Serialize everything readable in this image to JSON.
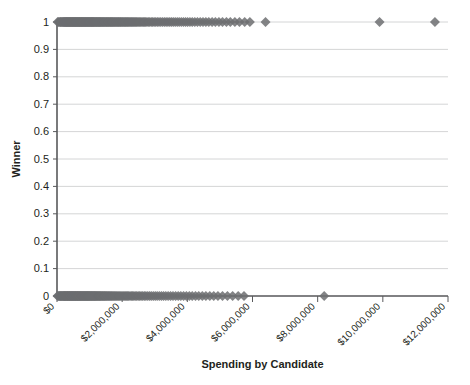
{
  "chart_data": {
    "type": "scatter",
    "title": "",
    "xlabel": "Spending by Candidate",
    "ylabel": "Winner",
    "xlim": [
      0,
      12000000
    ],
    "ylim": [
      0,
      1
    ],
    "grid": true,
    "grid_axis": "y",
    "legend": "none",
    "marker": "diamond",
    "marker_color": "#6d6e71",
    "marker_size": 5,
    "y_ticks": [
      0,
      0.1,
      0.2,
      0.3,
      0.4,
      0.5,
      0.6,
      0.7,
      0.8,
      0.9,
      1
    ],
    "y_tick_labels": [
      "0",
      "0.1",
      "0.2",
      "0.3",
      "0.4",
      "0.5",
      "0.6",
      "0.7",
      "0.8",
      "0.9",
      "1"
    ],
    "x_ticks": [
      0,
      2000000,
      4000000,
      6000000,
      8000000,
      10000000,
      12000000
    ],
    "x_tick_labels": [
      "$0",
      "$2,000,000",
      "$4,000,000",
      "$6,000,000",
      "$8,000,000",
      "$10,000,000",
      "$12,000,000"
    ],
    "x_tick_rotation": -45,
    "series": [
      {
        "name": "Winners",
        "y": 1,
        "x": [
          20000,
          45000,
          70000,
          95000,
          110000,
          130000,
          150000,
          168000,
          185000,
          200000,
          215000,
          228000,
          242000,
          255000,
          268000,
          280000,
          292000,
          305000,
          318000,
          330000,
          342000,
          355000,
          368000,
          380000,
          392000,
          405000,
          418000,
          430000,
          442000,
          455000,
          468000,
          480000,
          492000,
          505000,
          518000,
          530000,
          542000,
          555000,
          568000,
          580000,
          592000,
          605000,
          618000,
          630000,
          642000,
          655000,
          668000,
          680000,
          692000,
          705000,
          718000,
          730000,
          742000,
          755000,
          768000,
          780000,
          792000,
          805000,
          818000,
          830000,
          845000,
          858000,
          872000,
          885000,
          898000,
          912000,
          925000,
          938000,
          952000,
          965000,
          978000,
          992000,
          1005000,
          1018000,
          1032000,
          1045000,
          1058000,
          1072000,
          1085000,
          1098000,
          1112000,
          1125000,
          1140000,
          1155000,
          1170000,
          1185000,
          1200000,
          1215000,
          1230000,
          1245000,
          1260000,
          1275000,
          1290000,
          1305000,
          1320000,
          1335000,
          1350000,
          1368000,
          1385000,
          1400000,
          1418000,
          1435000,
          1452000,
          1470000,
          1488000,
          1505000,
          1522000,
          1540000,
          1558000,
          1575000,
          1592000,
          1610000,
          1628000,
          1645000,
          1662000,
          1680000,
          1698000,
          1715000,
          1735000,
          1755000,
          1775000,
          1795000,
          1815000,
          1835000,
          1855000,
          1875000,
          1895000,
          1915000,
          1935000,
          1955000,
          1975000,
          1998000,
          2020000,
          2042000,
          2065000,
          2088000,
          2110000,
          2132000,
          2155000,
          2178000,
          2200000,
          2225000,
          2250000,
          2275000,
          2300000,
          2325000,
          2350000,
          2378000,
          2405000,
          2432000,
          2460000,
          2490000,
          2520000,
          2550000,
          2580000,
          2615000,
          2650000,
          2685000,
          2720000,
          2760000,
          2800000,
          2845000,
          2890000,
          2935000,
          2980000,
          3030000,
          3080000,
          3130000,
          3185000,
          3240000,
          3295000,
          3350000,
          3405000,
          3460000,
          3515000,
          3570000,
          3630000,
          3690000,
          3750000,
          3815000,
          3880000,
          3945000,
          4010000,
          4080000,
          4150000,
          4230000,
          4310000,
          4395000,
          4480000,
          4570000,
          4660000,
          4760000,
          4860000,
          4970000,
          5080000,
          5200000,
          5320000,
          5460000,
          5600000,
          5760000,
          5920000,
          6400000,
          9900000,
          11600000
        ]
      },
      {
        "name": "Losers",
        "y": 0,
        "x": [
          15000,
          35000,
          55000,
          75000,
          90000,
          105000,
          120000,
          135000,
          150000,
          165000,
          180000,
          195000,
          208000,
          220000,
          232000,
          245000,
          258000,
          270000,
          282000,
          295000,
          308000,
          320000,
          332000,
          345000,
          358000,
          370000,
          382000,
          395000,
          408000,
          420000,
          432000,
          445000,
          458000,
          470000,
          482000,
          495000,
          508000,
          520000,
          532000,
          545000,
          558000,
          570000,
          582000,
          595000,
          608000,
          620000,
          632000,
          645000,
          658000,
          670000,
          682000,
          695000,
          708000,
          720000,
          735000,
          748000,
          762000,
          775000,
          788000,
          802000,
          815000,
          828000,
          842000,
          855000,
          868000,
          882000,
          895000,
          908000,
          922000,
          935000,
          948000,
          962000,
          975000,
          988000,
          1002000,
          1015000,
          1030000,
          1045000,
          1060000,
          1075000,
          1090000,
          1105000,
          1120000,
          1135000,
          1150000,
          1165000,
          1180000,
          1195000,
          1210000,
          1228000,
          1245000,
          1262000,
          1280000,
          1298000,
          1315000,
          1332000,
          1350000,
          1370000,
          1390000,
          1410000,
          1430000,
          1450000,
          1470000,
          1490000,
          1510000,
          1532000,
          1555000,
          1578000,
          1600000,
          1625000,
          1650000,
          1675000,
          1700000,
          1728000,
          1755000,
          1782000,
          1810000,
          1840000,
          1870000,
          1900000,
          1930000,
          1962000,
          1995000,
          2028000,
          2060000,
          2095000,
          2130000,
          2165000,
          2200000,
          2240000,
          2280000,
          2320000,
          2360000,
          2400000,
          2445000,
          2490000,
          2535000,
          2580000,
          2630000,
          2680000,
          2730000,
          2785000,
          2840000,
          2895000,
          2955000,
          3015000,
          3075000,
          3140000,
          3205000,
          3270000,
          3340000,
          3410000,
          3485000,
          3560000,
          3640000,
          3720000,
          3800000,
          3885000,
          3970000,
          4060000,
          4150000,
          4250000,
          4350000,
          4460000,
          4570000,
          4690000,
          4810000,
          4940000,
          5080000,
          5230000,
          5390000,
          5560000,
          5740000,
          8200000
        ]
      }
    ]
  }
}
